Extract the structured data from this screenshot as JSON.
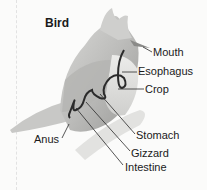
{
  "diagram": {
    "title": "Bird",
    "labels": {
      "mouth": "Mouth",
      "esophagus": "Esophagus",
      "crop": "Crop",
      "stomach": "Stomach",
      "gizzard": "Gizzard",
      "intestine": "Intestine",
      "anus": "Anus"
    }
  }
}
